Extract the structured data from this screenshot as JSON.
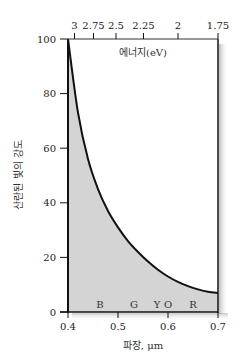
{
  "chart_data": {
    "type": "area",
    "title": "",
    "xlabel": "파장, μm",
    "ylabel": "산란된 빛의 강도",
    "top_axis_label": "에너지(eV)",
    "xlim": [
      0.4,
      0.7
    ],
    "ylim": [
      0,
      100
    ],
    "x_ticks": [
      "0.4",
      "0.5",
      "0.6",
      "0.7"
    ],
    "y_ticks": [
      "0",
      "20",
      "40",
      "60",
      "80",
      "100"
    ],
    "top_ticks": [
      {
        "label": "3",
        "wavelength": 0.413
      },
      {
        "label": "2.75",
        "wavelength": 0.451
      },
      {
        "label": "2.5",
        "wavelength": 0.496
      },
      {
        "label": "2.25",
        "wavelength": 0.551
      },
      {
        "label": "2",
        "wavelength": 0.62
      },
      {
        "label": "1.75",
        "wavelength": 0.7
      }
    ],
    "color_bands": [
      {
        "label": "B",
        "wavelength": 0.464
      },
      {
        "label": "G",
        "wavelength": 0.532
      },
      {
        "label": "Y",
        "wavelength": 0.578
      },
      {
        "label": "O",
        "wavelength": 0.6
      },
      {
        "label": "R",
        "wavelength": 0.65
      }
    ],
    "series": [
      {
        "name": "scattered intensity",
        "x": [
          0.4,
          0.42,
          0.44,
          0.46,
          0.48,
          0.5,
          0.52,
          0.54,
          0.56,
          0.58,
          0.6,
          0.62,
          0.64,
          0.66,
          0.68,
          0.7
        ],
        "values": [
          100,
          73,
          56,
          45,
          37,
          31,
          26,
          22,
          18.5,
          15.5,
          13,
          11,
          9.5,
          8.3,
          7.4,
          7
        ]
      }
    ],
    "grid": false,
    "legend": "none",
    "fill_color": "#d4d4d4",
    "line_color": "#111111"
  }
}
